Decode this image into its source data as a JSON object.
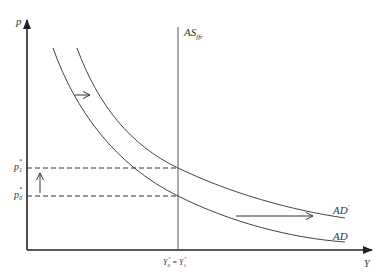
{
  "diagram": {
    "type": "economics-ad-as",
    "colors": {
      "axis": "#222222",
      "curve": "#444444",
      "dashed": "#333333"
    },
    "axes": {
      "y_label": "p",
      "x_label": "Y"
    },
    "supply_curve": {
      "label_main": "AS",
      "label_sub": "ffr"
    },
    "demand_curves": [
      {
        "id": "AD",
        "label_main": "AD",
        "label_sup": ""
      },
      {
        "id": "AD_prime",
        "label_main": "AD",
        "label_sup": "'"
      }
    ],
    "price_levels": [
      {
        "id": "p1",
        "label_main": "p",
        "label_sub": "1",
        "label_sup": "*"
      },
      {
        "id": "p0",
        "label_main": "p",
        "label_sub": "0",
        "label_sup": "*"
      }
    ],
    "output_level": {
      "left_main": "Y",
      "left_sub": "0",
      "left_sup": "*",
      "equals": "=",
      "right_main": "Y",
      "right_sub": "1",
      "right_sup": "*"
    },
    "annotations": [
      {
        "id": "shift-right-arrow-top",
        "direction": "right"
      },
      {
        "id": "shift-right-arrow-bottom",
        "direction": "right"
      },
      {
        "id": "price-rise-arrow",
        "direction": "up"
      }
    ]
  }
}
